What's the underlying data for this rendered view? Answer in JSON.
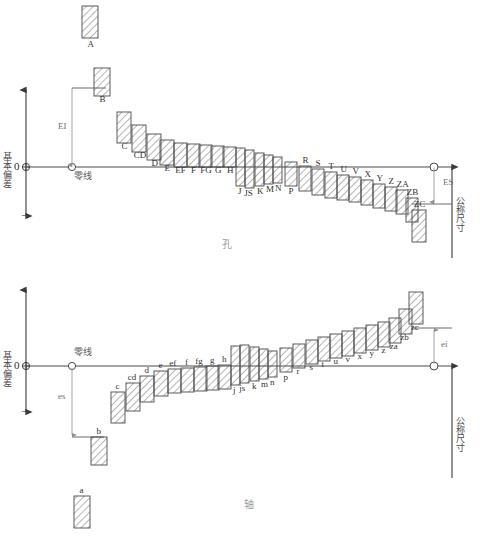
{
  "figure": {
    "title_hole": "孔",
    "title_shaft": "轴",
    "axis_label_vertical": "基本偏差",
    "axis_label_nominal": "公称尺寸",
    "zero_line_label": "零线",
    "zero_tick": "0",
    "plus_sign": "+",
    "minus_sign": "−"
  },
  "hole": {
    "deviation_lower_label": "EI",
    "deviation_upper_label": "ES",
    "zero_line_label": "零线",
    "axis_label": "基本偏差",
    "nominal_label": "公称尺寸",
    "section_title": "孔",
    "zones": [
      {
        "label": "A",
        "x": 82,
        "w": 16,
        "top": 6,
        "bottom": 38,
        "detached": true
      },
      {
        "label": "B",
        "x": 94,
        "w": 16,
        "top": 68,
        "bottom": 96,
        "detached": false
      },
      {
        "label": "C",
        "x": 117,
        "w": 14,
        "top": 112,
        "bottom": 143,
        "detached": false
      },
      {
        "label": "CD",
        "x": 132,
        "w": 14,
        "top": 125,
        "bottom": 152,
        "detached": false
      },
      {
        "label": "D",
        "x": 147,
        "w": 14,
        "top": 134,
        "bottom": 160,
        "detached": false
      },
      {
        "label": "E",
        "x": 160,
        "w": 14,
        "top": 140,
        "bottom": 165,
        "detached": false
      },
      {
        "label": "EF",
        "x": 174,
        "w": 13,
        "top": 143,
        "bottom": 167,
        "detached": false
      },
      {
        "label": "F",
        "x": 187,
        "w": 13,
        "top": 144,
        "bottom": 167,
        "detached": false
      },
      {
        "label": "FG",
        "x": 199,
        "w": 13,
        "top": 145,
        "bottom": 167,
        "detached": false
      },
      {
        "label": "G",
        "x": 211,
        "w": 13,
        "top": 146,
        "bottom": 167,
        "detached": false
      },
      {
        "label": "H",
        "x": 223,
        "w": 13,
        "top": 147,
        "bottom": 167,
        "detached": false
      },
      {
        "label": "J",
        "x": 236,
        "w": 9,
        "top": 148,
        "bottom": 186,
        "detached": false
      },
      {
        "label": "JS",
        "x": 245,
        "w": 9,
        "top": 150,
        "bottom": 188,
        "detached": false
      },
      {
        "label": "K",
        "x": 255,
        "w": 9,
        "top": 153,
        "bottom": 186,
        "detached": false
      },
      {
        "label": "M",
        "x": 264,
        "w": 9,
        "top": 155,
        "bottom": 184,
        "detached": false
      },
      {
        "label": "N",
        "x": 273,
        "w": 9,
        "top": 157,
        "bottom": 183,
        "detached": false
      },
      {
        "label": "P",
        "x": 285,
        "w": 12,
        "top": 162,
        "bottom": 186,
        "detached": false
      },
      {
        "label": "R",
        "x": 299,
        "w": 12,
        "top": 166,
        "bottom": 191,
        "detached": false
      },
      {
        "label": "S",
        "x": 312,
        "w": 12,
        "top": 169,
        "bottom": 195,
        "detached": false
      },
      {
        "label": "T",
        "x": 325,
        "w": 12,
        "top": 172,
        "bottom": 198,
        "detached": false
      },
      {
        "label": "U",
        "x": 337,
        "w": 12,
        "top": 175,
        "bottom": 200,
        "detached": false
      },
      {
        "label": "V",
        "x": 349,
        "w": 12,
        "top": 177,
        "bottom": 202,
        "detached": false
      },
      {
        "label": "X",
        "x": 361,
        "w": 12,
        "top": 180,
        "bottom": 205,
        "detached": false
      },
      {
        "label": "Y",
        "x": 373,
        "w": 12,
        "top": 184,
        "bottom": 208,
        "detached": false
      },
      {
        "label": "Z",
        "x": 385,
        "w": 12,
        "top": 187,
        "bottom": 211,
        "detached": false
      },
      {
        "label": "ZA",
        "x": 396,
        "w": 12,
        "top": 190,
        "bottom": 214,
        "detached": false
      },
      {
        "label": "ZB",
        "x": 406,
        "w": 12,
        "top": 198,
        "bottom": 222,
        "detached": false
      },
      {
        "label": "ZC",
        "x": 412,
        "w": 14,
        "top": 210,
        "bottom": 242,
        "detached": false
      }
    ]
  },
  "shaft": {
    "deviation_upper_label": "es",
    "deviation_lower_label": "ei",
    "zero_line_label": "零线",
    "axis_label": "基本偏差",
    "nominal_label": "公称尺寸",
    "section_title": "轴",
    "zones": [
      {
        "label": "a",
        "x": 74,
        "w": 16,
        "top": 496,
        "bottom": 528,
        "detached": true
      },
      {
        "label": "b",
        "x": 91,
        "w": 16,
        "top": 437,
        "bottom": 465,
        "detached": false
      },
      {
        "label": "c",
        "x": 111,
        "w": 14,
        "top": 392,
        "bottom": 423,
        "detached": false
      },
      {
        "label": "cd",
        "x": 126,
        "w": 14,
        "top": 383,
        "bottom": 411,
        "detached": false
      },
      {
        "label": "d",
        "x": 140,
        "w": 14,
        "top": 376,
        "bottom": 402,
        "detached": false
      },
      {
        "label": "e",
        "x": 154,
        "w": 14,
        "top": 371,
        "bottom": 396,
        "detached": false
      },
      {
        "label": "ef",
        "x": 168,
        "w": 13,
        "top": 369,
        "bottom": 393,
        "detached": false
      },
      {
        "label": "f",
        "x": 181,
        "w": 13,
        "top": 368,
        "bottom": 392,
        "detached": false
      },
      {
        "label": "fg",
        "x": 194,
        "w": 13,
        "top": 367,
        "bottom": 391,
        "detached": false
      },
      {
        "label": "g",
        "x": 206,
        "w": 13,
        "top": 366,
        "bottom": 390,
        "detached": false
      },
      {
        "label": "h",
        "x": 218,
        "w": 13,
        "top": 365,
        "bottom": 389,
        "detached": false
      },
      {
        "label": "j",
        "x": 231,
        "w": 9,
        "top": 346,
        "bottom": 385,
        "detached": false
      },
      {
        "label": "js",
        "x": 240,
        "w": 9,
        "top": 345,
        "bottom": 383,
        "detached": false
      },
      {
        "label": "k",
        "x": 250,
        "w": 9,
        "top": 347,
        "bottom": 381,
        "detached": false
      },
      {
        "label": "m",
        "x": 259,
        "w": 9,
        "top": 349,
        "bottom": 379,
        "detached": false
      },
      {
        "label": "n",
        "x": 268,
        "w": 9,
        "top": 351,
        "bottom": 377,
        "detached": false
      },
      {
        "label": "p",
        "x": 280,
        "w": 12,
        "top": 348,
        "bottom": 372,
        "detached": false
      },
      {
        "label": "r",
        "x": 293,
        "w": 12,
        "top": 344,
        "bottom": 368,
        "detached": false
      },
      {
        "label": "s",
        "x": 306,
        "w": 12,
        "top": 340,
        "bottom": 364,
        "detached": false
      },
      {
        "label": "t",
        "x": 318,
        "w": 12,
        "top": 337,
        "bottom": 361,
        "detached": false
      },
      {
        "label": "u",
        "x": 330,
        "w": 12,
        "top": 334,
        "bottom": 358,
        "detached": false
      },
      {
        "label": "v",
        "x": 342,
        "w": 12,
        "top": 331,
        "bottom": 356,
        "detached": false
      },
      {
        "label": "x",
        "x": 354,
        "w": 12,
        "top": 328,
        "bottom": 353,
        "detached": false
      },
      {
        "label": "y",
        "x": 366,
        "w": 12,
        "top": 325,
        "bottom": 350,
        "detached": false
      },
      {
        "label": "z",
        "x": 378,
        "w": 12,
        "top": 322,
        "bottom": 347,
        "detached": false
      },
      {
        "label": "za",
        "x": 389,
        "w": 12,
        "top": 318,
        "bottom": 343,
        "detached": false
      },
      {
        "label": "zb",
        "x": 399,
        "w": 13,
        "top": 309,
        "bottom": 334,
        "detached": false
      },
      {
        "label": "zc",
        "x": 409,
        "w": 14,
        "top": 292,
        "bottom": 324,
        "detached": false
      }
    ]
  },
  "chart_data": {
    "type": "bar",
    "xlabel": "公称尺寸",
    "ylabel": "基本偏差",
    "grid": false,
    "legend": "none",
    "series": [
      {
        "name": "孔 (holes)",
        "categories": [
          "A",
          "B",
          "C",
          "CD",
          "D",
          "E",
          "EF",
          "F",
          "FG",
          "G",
          "H",
          "J",
          "JS",
          "K",
          "M",
          "N",
          "P",
          "R",
          "S",
          "T",
          "U",
          "V",
          "X",
          "Y",
          "Z",
          "ZA",
          "ZB",
          "ZC"
        ],
        "note": "Lower deviation EI positive and decreasing toward H; from J onward upper deviation ES becomes negative and increasingly so.",
        "deviation_sign": [
          "+",
          "+",
          "+",
          "+",
          "+",
          "+",
          "+",
          "+",
          "+",
          "+",
          "0",
          "±",
          "±",
          "−",
          "−",
          "−",
          "−",
          "−",
          "−",
          "−",
          "−",
          "−",
          "−",
          "−",
          "−",
          "−",
          "−",
          "−"
        ]
      },
      {
        "name": "轴 (shafts)",
        "categories": [
          "a",
          "b",
          "c",
          "cd",
          "d",
          "e",
          "ef",
          "f",
          "fg",
          "g",
          "h",
          "j",
          "js",
          "k",
          "m",
          "n",
          "p",
          "r",
          "s",
          "t",
          "u",
          "v",
          "x",
          "y",
          "z",
          "za",
          "zb",
          "zc"
        ],
        "note": "Upper deviation es negative and increasing toward h; from j onward lower deviation ei becomes positive and increasingly so.",
        "deviation_sign": [
          "−",
          "−",
          "−",
          "−",
          "−",
          "−",
          "−",
          "−",
          "−",
          "−",
          "0",
          "±",
          "±",
          "+",
          "+",
          "+",
          "+",
          "+",
          "+",
          "+",
          "+",
          "+",
          "+",
          "+",
          "+",
          "+",
          "+",
          "+"
        ]
      }
    ]
  }
}
